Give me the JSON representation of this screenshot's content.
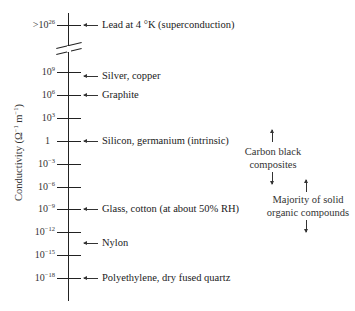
{
  "diagram": {
    "axis_label": {
      "text": "Conductivity (Ω",
      "exp1": "−1",
      "mid": " m",
      "exp2": "−1",
      "close": ")"
    },
    "ticks": [
      {
        "base": ">10",
        "exp": "26",
        "y": 25
      },
      {
        "base": "10",
        "exp": "9",
        "y": 72
      },
      {
        "base": "10",
        "exp": "6",
        "y": 95
      },
      {
        "base": "10",
        "exp": "3",
        "y": 118
      },
      {
        "base": "1",
        "exp": "",
        "y": 141
      },
      {
        "base": "10",
        "exp": "−3",
        "y": 164
      },
      {
        "base": "10",
        "exp": "−6",
        "y": 187
      },
      {
        "base": "10",
        "exp": "−9",
        "y": 209
      },
      {
        "base": "10",
        "exp": "−12",
        "y": 232
      },
      {
        "base": "10",
        "exp": "−15",
        "y": 255
      },
      {
        "base": "10",
        "exp": "−18",
        "y": 278
      }
    ],
    "materials": [
      {
        "label": "Lead at 4 °K (superconduction)",
        "y": 25
      },
      {
        "label": "Silver, copper",
        "y": 76
      },
      {
        "label": "Graphite",
        "y": 95
      },
      {
        "label": "Silicon, germanium (intrinsic)",
        "y": 141
      },
      {
        "label": "Glass, cotton (at about 50% RH)",
        "y": 209
      },
      {
        "label": "Nylon",
        "y": 243
      },
      {
        "label": "Polyethylene, dry fused quartz",
        "y": 278
      }
    ],
    "ranges": [
      {
        "line1": "Carbon black",
        "line2": "composites"
      },
      {
        "line1": "Majority of solid",
        "line2": "organic compounds"
      }
    ]
  }
}
